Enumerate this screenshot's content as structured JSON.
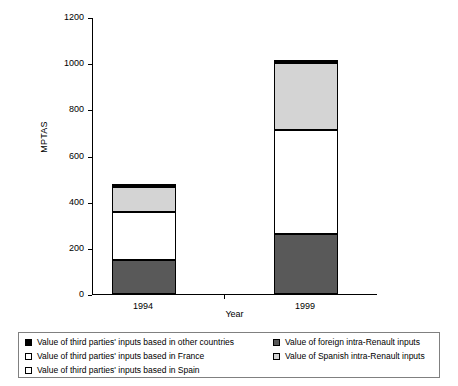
{
  "chart_data": {
    "type": "bar",
    "subtype": "stacked",
    "title": "",
    "xlabel": "Year",
    "ylabel": "MPTAS",
    "categories": [
      "1994",
      "1999"
    ],
    "ylim": [
      0,
      1200
    ],
    "yticks": [
      0,
      200,
      400,
      600,
      800,
      1000,
      1200
    ],
    "ytick_labels": [
      "0",
      "200",
      "400",
      "600",
      "800",
      "1000",
      "1200"
    ],
    "grid": false,
    "legend_position": "bottom",
    "series": [
      {
        "name": "Value of Spanish intra-Renault inputs",
        "color": "#595959",
        "swatch": "dkgray",
        "values": [
          147,
          260
        ]
      },
      {
        "name": "Value of third parties' inputs based in Spain",
        "color": "#ffffff",
        "swatch": "white",
        "values": [
          208,
          450
        ]
      },
      {
        "name": "Value of third parties' inputs based in France",
        "color": "#d4d4d4",
        "swatch": "ltgray",
        "values": [
          107,
          290
        ]
      },
      {
        "name": "Value of third parties' inputs based in other countries",
        "color": "#000000",
        "swatch": "black",
        "values": [
          13,
          15
        ]
      }
    ],
    "totals": [
      475,
      1015
    ],
    "stack_boundaries": {
      "1994": [
        0,
        147,
        355,
        462,
        475
      ],
      "1999": [
        0,
        260,
        710,
        1000,
        1015
      ]
    }
  },
  "legend": {
    "left_column": [
      {
        "swatch": "black",
        "label": "Value of third parties' inputs based in other countries"
      },
      {
        "swatch": "white",
        "label": "Value of third parties' inputs based in France"
      },
      {
        "swatch": "white",
        "label": "Value of third parties' inputs based in Spain"
      }
    ],
    "right_column": [
      {
        "swatch": "dkgray",
        "label": "Value of foreign intra-Renault inputs"
      },
      {
        "swatch": "ltgray",
        "label": "Value of Spanish intra-Renault inputs"
      }
    ]
  },
  "axes": {
    "y_title": "MPTAS",
    "x_title": "Year",
    "y_labels": [
      "1200",
      "1000",
      "800",
      "600",
      "400",
      "200",
      "0"
    ],
    "x_labels": [
      "1994",
      "1999"
    ]
  }
}
